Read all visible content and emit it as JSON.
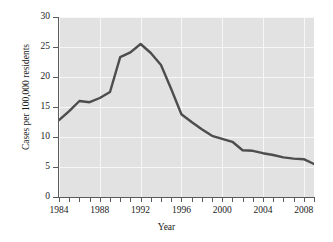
{
  "chart_data": {
    "type": "line",
    "title": "",
    "xlabel": "Year",
    "ylabel": "Cases per 100,000 residents",
    "xlim": [
      1984,
      2009
    ],
    "ylim": [
      0,
      30
    ],
    "grid": true,
    "legend": "none",
    "x": [
      1984,
      1985,
      1986,
      1987,
      1988,
      1989,
      1990,
      1991,
      1992,
      1993,
      1994,
      1995,
      1996,
      1997,
      1998,
      1999,
      2000,
      2001,
      2002,
      2003,
      2004,
      2005,
      2006,
      2007,
      2008,
      2009
    ],
    "series": [
      {
        "name": "Cases per 100,000 residents",
        "color": "#4d4d4d",
        "values": [
          12.8,
          14.3,
          16.0,
          15.8,
          16.5,
          17.5,
          23.3,
          24.1,
          25.5,
          24.0,
          22.0,
          18.0,
          13.8,
          12.5,
          11.3,
          10.2,
          9.7,
          9.2,
          7.8,
          7.7,
          7.3,
          7.0,
          6.6,
          6.4,
          6.3,
          5.5
        ]
      }
    ],
    "x_tick_values": [
      1984,
      1985,
      1986,
      1987,
      1988,
      1989,
      1990,
      1991,
      1992,
      1993,
      1994,
      1995,
      1996,
      1997,
      1998,
      1999,
      2000,
      2001,
      2002,
      2003,
      2004,
      2005,
      2006,
      2007,
      2008,
      2009
    ],
    "x_tick_labels": [
      "1984",
      "",
      "",
      "",
      "1988",
      "",
      "",
      "",
      "1992",
      "",
      "",
      "",
      "1996",
      "",
      "",
      "",
      "2000",
      "",
      "",
      "",
      "2004",
      "",
      "",
      "",
      "2008",
      ""
    ],
    "y_tick_values": [
      0,
      5,
      10,
      15,
      20,
      25,
      30
    ],
    "y_tick_labels": [
      "0",
      "5",
      "10",
      "15",
      "20",
      "25",
      "30"
    ],
    "plot_background": "#e2e2e2",
    "gridline_color": "#f7f7f7",
    "axis_color": "#5a5a5a",
    "page_background": "#ffffff"
  }
}
